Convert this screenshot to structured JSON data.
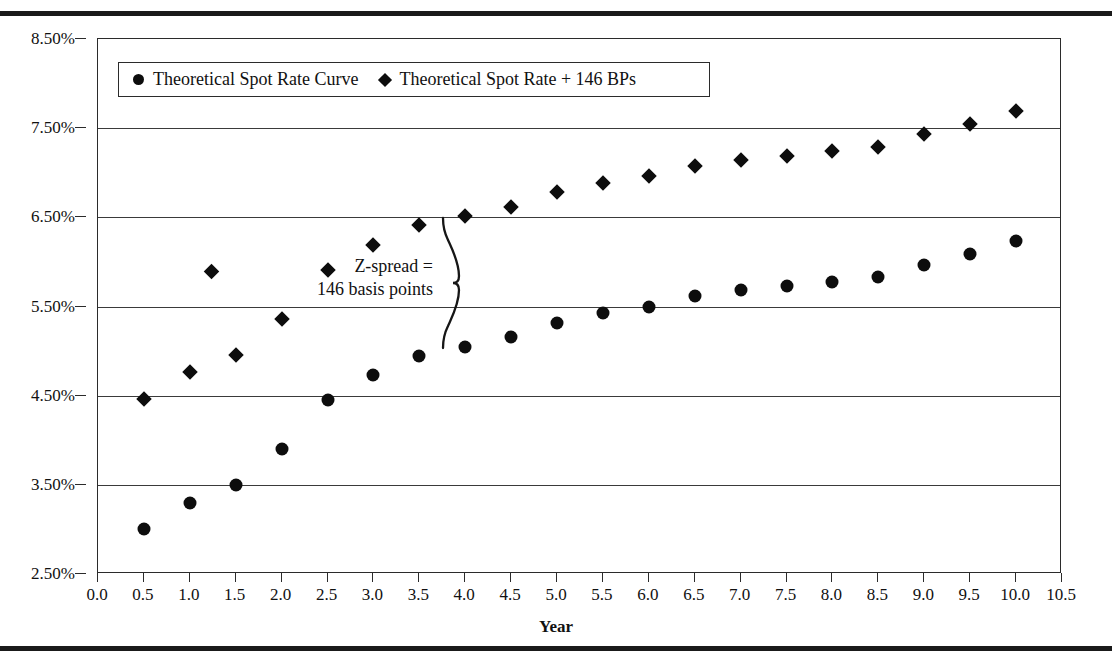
{
  "figure": {
    "x_axis_title": "Year",
    "annotation_text": "Z-spread =\n146 basis points",
    "legend": [
      {
        "label": "Theoretical Spot Rate Curve",
        "marker": "circle"
      },
      {
        "label": "Theoretical Spot Rate + 146 BPs",
        "marker": "diamond"
      }
    ]
  },
  "chart_data": {
    "type": "scatter",
    "title": "",
    "xlabel": "Year",
    "ylabel": "",
    "xlim": [
      0.0,
      10.5
    ],
    "ylim": [
      2.5,
      8.5
    ],
    "grid": true,
    "legend_position": "top-left-inside",
    "x_tick_labels": [
      "0.0",
      "0.5",
      "1.0",
      "1.5",
      "2.0",
      "2.5",
      "3.0",
      "3.5",
      "4.0",
      "4.5",
      "5.0",
      "5.5",
      "6.0",
      "6.5",
      "7.0",
      "7.5",
      "8.0",
      "8.5",
      "9.0",
      "9.5",
      "10.0",
      "10.5"
    ],
    "x_ticks": [
      0.0,
      0.5,
      1.0,
      1.5,
      2.0,
      2.5,
      3.0,
      3.5,
      4.0,
      4.5,
      5.0,
      5.5,
      6.0,
      6.5,
      7.0,
      7.5,
      8.0,
      8.5,
      9.0,
      9.5,
      10.0,
      10.5
    ],
    "y_tick_labels": [
      "2.50%",
      "3.50%",
      "4.50%",
      "5.50%",
      "6.50%",
      "7.50%",
      "8.50%"
    ],
    "y_ticks": [
      2.5,
      3.5,
      4.5,
      5.5,
      6.5,
      7.5,
      8.5
    ],
    "x": [
      0.5,
      1.0,
      1.5,
      2.0,
      2.5,
      3.0,
      3.5,
      4.0,
      4.5,
      5.0,
      5.5,
      6.0,
      6.5,
      7.0,
      7.5,
      8.0,
      8.5,
      9.0,
      9.5,
      10.0
    ],
    "series": [
      {
        "name": "Theoretical Spot Rate Curve",
        "marker": "circle",
        "values": [
          3.0,
          3.3,
          3.5,
          3.9,
          4.45,
          4.73,
          4.95,
          5.05,
          5.16,
          5.32,
          5.43,
          5.5,
          5.62,
          5.68,
          5.73,
          5.78,
          5.83,
          5.97,
          6.09,
          6.23
        ]
      },
      {
        "name": "Theoretical Spot Rate + 146 BPs",
        "marker": "diamond",
        "values": [
          4.46,
          4.76,
          4.96,
          5.36,
          5.91,
          6.19,
          6.41,
          6.51,
          6.62,
          6.78,
          6.89,
          6.96,
          7.08,
          7.14,
          7.19,
          7.24,
          7.29,
          7.43,
          7.55,
          7.69
        ]
      }
    ],
    "annotations": [
      {
        "name": "z-spread",
        "text": "Z-spread =\n146 basis points",
        "value_bp": 146,
        "x": 4.0,
        "y_top": 6.51,
        "y_bottom": 5.05
      }
    ]
  }
}
